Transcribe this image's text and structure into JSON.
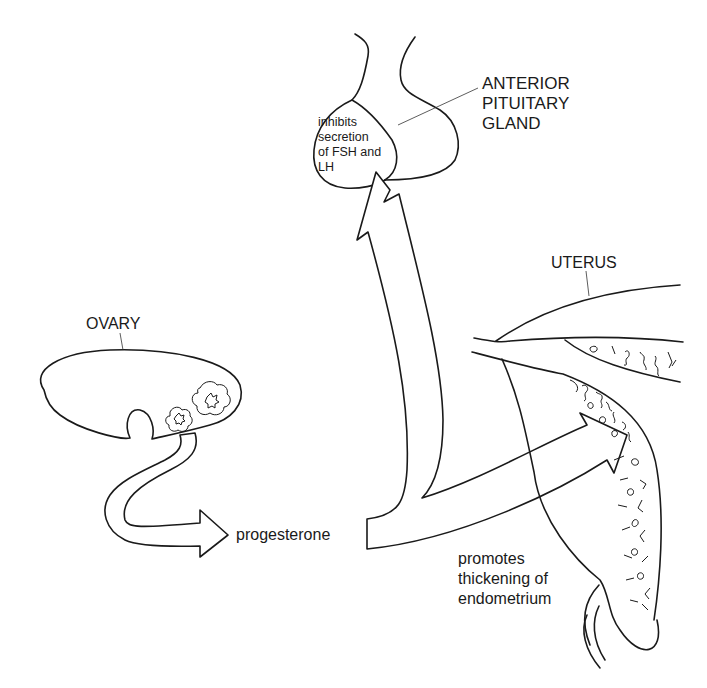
{
  "diagram": {
    "type": "biological-process",
    "nodes": [
      {
        "id": "ovary",
        "label": "OVARY"
      },
      {
        "id": "progesterone",
        "label": "progesterone"
      },
      {
        "id": "pituitary",
        "label": "ANTERIOR\nPITUITARY\nGLAND"
      },
      {
        "id": "uterus",
        "label": "UTERUS"
      }
    ],
    "edges": [
      {
        "from": "ovary",
        "to": "progesterone",
        "label": ""
      },
      {
        "from": "progesterone",
        "to": "pituitary",
        "label": "inhibits\nsecretion\nof FSH and\nLH"
      },
      {
        "from": "progesterone",
        "to": "uterus",
        "label": "promotes\nthickening of\nendometrium"
      }
    ]
  },
  "labels": {
    "pituitary": "ANTERIOR\nPITUITARY\nGLAND",
    "pituitary_effect": "inhibits\nsecretion\nof FSH and\nLH",
    "uterus": "UTERUS",
    "ovary": "OVARY",
    "hormone": "progesterone",
    "uterus_effect": "promotes\nthickening of\nendometrium"
  }
}
